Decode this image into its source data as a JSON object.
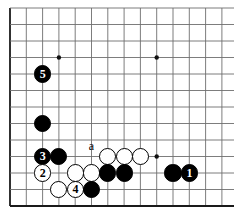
{
  "diagram": {
    "type": "go-board-diagram",
    "board": {
      "columns": 14,
      "rows": 13,
      "origin_x": 10,
      "origin_y": 8,
      "cell": 16.3,
      "cell_y": 16.5,
      "line_color": "#6e6e6e",
      "edge_color": "#1a1a1a",
      "background": "#ffffff",
      "edges": {
        "left": true,
        "bottom": true,
        "top": false,
        "right": false
      },
      "star_points": [
        {
          "col": 3,
          "row": 3
        },
        {
          "col": 9,
          "row": 3
        },
        {
          "col": 9,
          "row": 9
        }
      ]
    },
    "stones": [
      {
        "id": "stone-5",
        "color": "black",
        "col": 2,
        "row": 4,
        "label": "5"
      },
      {
        "id": "stone-b1",
        "color": "black",
        "col": 2,
        "row": 7,
        "label": ""
      },
      {
        "id": "stone-3",
        "color": "black",
        "col": 2,
        "row": 9,
        "label": "3"
      },
      {
        "id": "stone-b2",
        "color": "black",
        "col": 3,
        "row": 9,
        "label": ""
      },
      {
        "id": "stone-w1",
        "color": "white",
        "col": 6,
        "row": 9,
        "label": ""
      },
      {
        "id": "stone-w2",
        "color": "white",
        "col": 7,
        "row": 9,
        "label": ""
      },
      {
        "id": "stone-w3",
        "color": "white",
        "col": 8,
        "row": 9,
        "label": ""
      },
      {
        "id": "stone-2",
        "color": "white",
        "col": 2,
        "row": 10,
        "label": "2"
      },
      {
        "id": "stone-w4",
        "color": "white",
        "col": 4,
        "row": 10,
        "label": ""
      },
      {
        "id": "stone-w5",
        "color": "white",
        "col": 5,
        "row": 10,
        "label": ""
      },
      {
        "id": "stone-b3",
        "color": "black",
        "col": 6,
        "row": 10,
        "label": ""
      },
      {
        "id": "stone-b4",
        "color": "black",
        "col": 7,
        "row": 10,
        "label": ""
      },
      {
        "id": "stone-b5",
        "color": "black",
        "col": 10,
        "row": 10,
        "label": ""
      },
      {
        "id": "stone-1",
        "color": "black",
        "col": 11,
        "row": 10,
        "label": "1"
      },
      {
        "id": "stone-w6",
        "color": "white",
        "col": 3,
        "row": 11,
        "label": ""
      },
      {
        "id": "stone-4",
        "color": "white",
        "col": 4,
        "row": 11,
        "label": "4"
      },
      {
        "id": "stone-b6",
        "color": "black",
        "col": 5,
        "row": 11,
        "label": ""
      }
    ],
    "point_labels": [
      {
        "id": "label-a",
        "text": "a",
        "col": 5,
        "row": 8.35
      }
    ],
    "move_numbers": [
      "1",
      "2",
      "3",
      "4",
      "5"
    ],
    "stone_radius": 8.6
  }
}
